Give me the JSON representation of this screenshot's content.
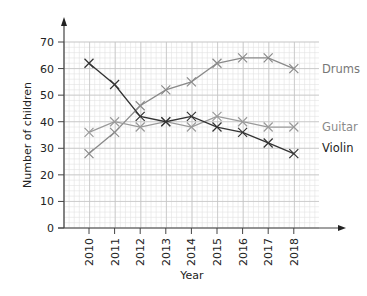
{
  "chart_data": {
    "type": "line",
    "title": "",
    "xlabel": "Year",
    "ylabel": "Number of children",
    "categories": [
      "2010",
      "2011",
      "2012",
      "2013",
      "2014",
      "2015",
      "2016",
      "2017",
      "2018"
    ],
    "ylim": [
      0,
      70
    ],
    "yticks": [
      0,
      10,
      20,
      30,
      40,
      50,
      60,
      70
    ],
    "grid": true,
    "legend_position": "right, inline at line ends",
    "marker": "x",
    "series": [
      {
        "name": "Drums",
        "color": "#8a8a8a",
        "label_color": "#777777",
        "values": [
          28,
          36,
          46,
          52,
          55,
          62,
          64,
          64,
          60
        ]
      },
      {
        "name": "Guitar",
        "color": "#9a9a9a",
        "label_color": "#8a8a8a",
        "values": [
          36,
          40,
          38,
          40,
          38,
          42,
          40,
          38,
          38
        ]
      },
      {
        "name": "Violin",
        "color": "#333333",
        "label_color": "#222222",
        "values": [
          62,
          54,
          42,
          40,
          42,
          38,
          36,
          32,
          28
        ]
      }
    ]
  }
}
